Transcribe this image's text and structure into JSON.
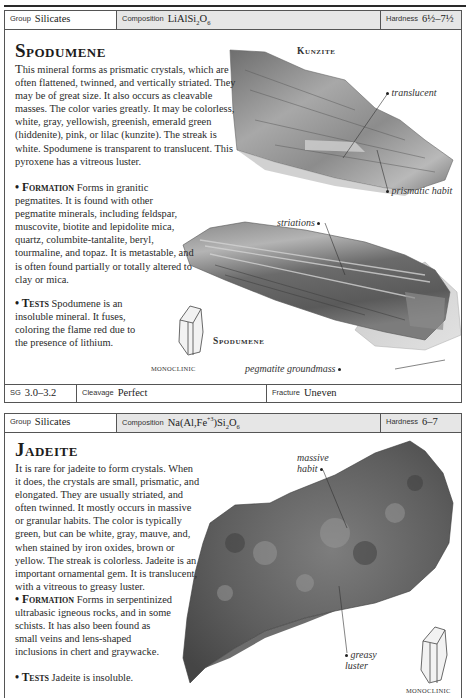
{
  "entries": [
    {
      "header": {
        "group_label": "Group",
        "group_value": "Silicates",
        "composition_label": "Composition",
        "composition_value_html": "LiAlSi<sub>2</sub>O<sub>6</sub>",
        "composition_value": "LiAlSi2O6",
        "hardness_label": "Hardness",
        "hardness_value": "6½–7½"
      },
      "title": "Spodumene",
      "description": "This mineral forms as prismatic crystals, which are often flattened, twinned, and vertically striated. They may be of great size. It also occurs as cleavable masses. The color varies greatly. It may be colorless, white, gray, yellowish, greenish, emerald green (hiddenite), pink, or lilac (kunzite). The streak is white. Spodumene is transparent to translucent. This pyroxene has a vitreous luster.",
      "description_lead": "T",
      "description_rest": "his mineral forms as prismatic crystals, which are often flattened, twinned, and vertically striated. They may be of great size. It also occurs as cleavable masses. The color varies greatly. It may be colorless, white, gray, yellowish, greenish, emerald green (hiddenite), pink, or lilac (kunzite). The streak is white. Spodumene is transparent to translucent. This pyroxene has a vitreous luster.",
      "formation_head": "• Formation",
      "formation_text": "Forms in granitic pegmatites. It is found with other pegmatite minerals, including feldspar, muscovite, biotite and lepidolite mica, quartz, columbite-tantalite, beryl, tourmaline, and topaz. It is metastable, and is often found partially or totally altered to clay or mica.",
      "tests_head": "• Tests",
      "tests_text": "Spodumene is an insoluble mineral. It fuses, coloring the flame red due to the presence of lithium.",
      "specimens": [
        {
          "caption": "Kunzite",
          "callouts": [
            "translucent",
            "prismatic habit"
          ]
        },
        {
          "caption": "Spodumene",
          "callouts": [
            "striations",
            "pegmatite groundmass"
          ]
        }
      ],
      "crystal_system": "MONOCLINIC",
      "footer": {
        "sg_label": "SG",
        "sg_value": "3.0–3.2",
        "cleavage_label": "Cleavage",
        "cleavage_value": "Perfect",
        "fracture_label": "Fracture",
        "fracture_value": "Uneven"
      }
    },
    {
      "header": {
        "group_label": "Group",
        "group_value": "Silicates",
        "composition_label": "Composition",
        "composition_value_html": "Na(Al,Fe<sup>+3</sup>)Si<sub>2</sub>O<sub>6</sub>",
        "composition_value": "Na(Al,Fe+3)Si2O6",
        "hardness_label": "Hardness",
        "hardness_value": "6–7"
      },
      "title": "Jadeite",
      "description_lead": "I",
      "description_rest": "t is rare for jadeite to form crystals. When it does, the crystals are small, prismatic, and elongated. They are usually striated, and often twinned. It mostly occurs in massive or granular habits. The color is typically green, but can be white, gray, mauve, and, when stained by iron oxides, brown or yellow. The streak is colorless. Jadeite is an important ornamental gem. It is translucent, with a vitreous to greasy luster.",
      "formation_head": "• Formation",
      "formation_text": "Forms in serpentinized ultrabasic igneous rocks, and in some schists. It has also been found as small veins and lens-shaped inclusions in chert and graywacke.",
      "tests_head": "• Tests",
      "tests_text": "Jadeite is insoluble.",
      "specimens": [
        {
          "caption": "",
          "callouts": [
            "massive habit",
            "greasy luster"
          ]
        }
      ],
      "crystal_system": "MONOCLINIC"
    }
  ],
  "colors": {
    "rule": "#2a2a2a",
    "border": "#555555",
    "shaded_cell": "#e6e6e6",
    "text": "#2a2a2a"
  }
}
